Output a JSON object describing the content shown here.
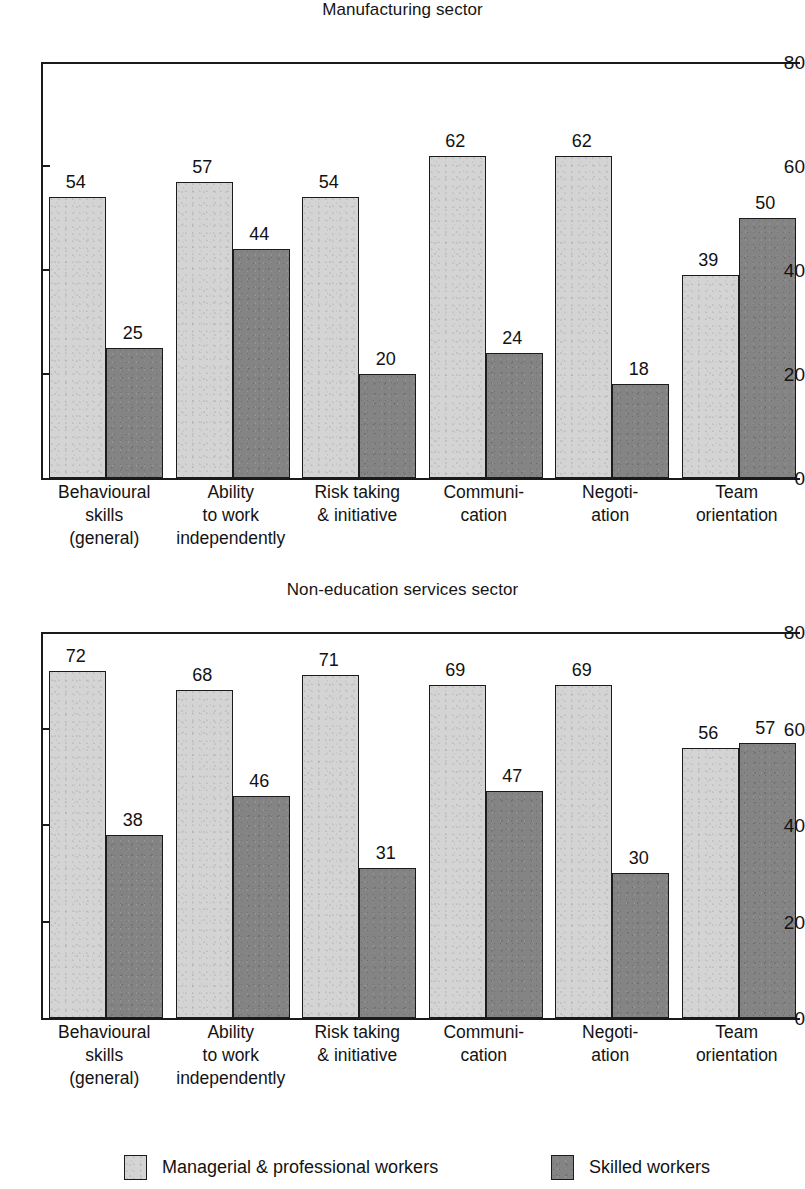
{
  "chart_data": [
    {
      "type": "bar",
      "title": "Manufacturing sector",
      "xlabel": "",
      "ylabel": "",
      "ylim": [
        0,
        80
      ],
      "yticks": [
        0,
        20,
        40,
        60,
        80
      ],
      "grid": false,
      "legend_position": "bottom",
      "categories": [
        "Behavioural\nskills\n(general)",
        "Ability\nto work\nindependently",
        "Risk taking\n& initiative",
        "Communi-\ncation",
        "Negoti-\nation",
        "Team\norientation"
      ],
      "series": [
        {
          "name": "Managerial & professional workers",
          "color": "#d4d4d4",
          "values": [
            54,
            57,
            54,
            62,
            62,
            39
          ]
        },
        {
          "name": "Skilled workers",
          "color": "#848484",
          "values": [
            25,
            44,
            20,
            24,
            18,
            50
          ]
        }
      ]
    },
    {
      "type": "bar",
      "title": "Non-education services sector",
      "xlabel": "",
      "ylabel": "",
      "ylim": [
        0,
        80
      ],
      "yticks": [
        0,
        20,
        40,
        60,
        80
      ],
      "grid": false,
      "legend_position": "bottom",
      "categories": [
        "Behavioural\nskills\n(general)",
        "Ability\nto work\nindependently",
        "Risk taking\n& initiative",
        "Communi-\ncation",
        "Negoti-\nation",
        "Team\norientation"
      ],
      "series": [
        {
          "name": "Managerial & professional workers",
          "color": "#d4d4d4",
          "values": [
            72,
            68,
            71,
            69,
            69,
            56
          ]
        },
        {
          "name": "Skilled workers",
          "color": "#848484",
          "values": [
            38,
            46,
            31,
            47,
            30,
            57
          ]
        }
      ]
    }
  ],
  "legend": {
    "items": [
      {
        "label": "Managerial & professional workers",
        "color": "#d4d4d4"
      },
      {
        "label": "Skilled workers",
        "color": "#848484"
      }
    ]
  }
}
